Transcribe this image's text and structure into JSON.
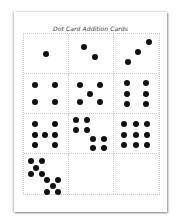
{
  "document": {
    "title": "Dot Card Addition Cards"
  },
  "cards": [
    {
      "id": 1,
      "count": 1,
      "dots": [
        [
          50,
          50
        ]
      ]
    },
    {
      "id": 2,
      "count": 2,
      "dots": [
        [
          35,
          33
        ],
        [
          60,
          60
        ]
      ]
    },
    {
      "id": 3,
      "count": 3,
      "dots": [
        [
          78,
          20
        ],
        [
          53,
          45
        ],
        [
          30,
          73
        ]
      ]
    },
    {
      "id": 4,
      "count": 4,
      "dots": [
        [
          25,
          28
        ],
        [
          70,
          28
        ],
        [
          25,
          73
        ],
        [
          70,
          73
        ]
      ]
    },
    {
      "id": 5,
      "count": 5,
      "dots": [
        [
          25,
          28
        ],
        [
          70,
          28
        ],
        [
          48,
          50
        ],
        [
          25,
          73
        ],
        [
          70,
          73
        ]
      ]
    },
    {
      "id": 6,
      "count": 6,
      "dots": [
        [
          28,
          22
        ],
        [
          72,
          22
        ],
        [
          28,
          50
        ],
        [
          72,
          50
        ],
        [
          28,
          78
        ],
        [
          72,
          78
        ]
      ]
    },
    {
      "id": 7,
      "count": 7,
      "dots": [
        [
          25,
          25
        ],
        [
          70,
          25
        ],
        [
          25,
          53
        ],
        [
          48,
          53
        ],
        [
          70,
          53
        ],
        [
          25,
          80
        ],
        [
          70,
          80
        ]
      ]
    },
    {
      "id": 8,
      "count": 8,
      "dots": [
        [
          15,
          15
        ],
        [
          40,
          15
        ],
        [
          15,
          40
        ],
        [
          40,
          40
        ],
        [
          55,
          63
        ],
        [
          80,
          63
        ],
        [
          55,
          88
        ],
        [
          80,
          88
        ]
      ]
    },
    {
      "id": 9,
      "count": 9,
      "dots": [
        [
          22,
          25
        ],
        [
          48,
          25
        ],
        [
          73,
          25
        ],
        [
          22,
          53
        ],
        [
          48,
          53
        ],
        [
          73,
          53
        ],
        [
          22,
          80
        ],
        [
          48,
          80
        ],
        [
          73,
          80
        ]
      ]
    },
    {
      "id": 10,
      "count": 10,
      "dots": [
        [
          15,
          18
        ],
        [
          40,
          18
        ],
        [
          28,
          35
        ],
        [
          15,
          50
        ],
        [
          40,
          50
        ],
        [
          52,
          65
        ],
        [
          78,
          65
        ],
        [
          65,
          80
        ],
        [
          52,
          95
        ],
        [
          78,
          95
        ]
      ]
    },
    {
      "id": 11,
      "count": 0,
      "dots": []
    },
    {
      "id": 12,
      "count": 0,
      "dots": []
    }
  ]
}
